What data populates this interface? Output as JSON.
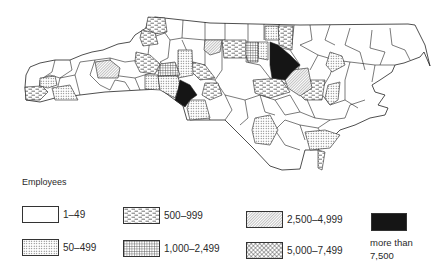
{
  "map": {
    "region": "North Carolina counties",
    "fill_colors": {
      "outline": "#222222",
      "background": "#ffffff",
      "solid": "#151515",
      "dots": "#555555"
    }
  },
  "legend": {
    "title": "Employees",
    "items": [
      {
        "label": "1–49",
        "pattern": "blank"
      },
      {
        "label": "50–499",
        "pattern": "dots"
      },
      {
        "label": "500–999",
        "pattern": "dashes"
      },
      {
        "label": "1,000–2,499",
        "pattern": "grid"
      },
      {
        "label": "2,500–4,999",
        "pattern": "diagonal-hatch"
      },
      {
        "label": "5,000–7,499",
        "pattern": "crosshatch"
      },
      {
        "label": "more than",
        "label_line2": "7,500",
        "pattern": "solid"
      }
    ]
  }
}
